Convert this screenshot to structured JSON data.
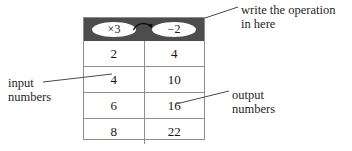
{
  "diagram": {
    "header": {
      "background_color": "#4d4d4d",
      "input_operation": "×3",
      "output_operation": "−2",
      "arrow_icon": "curved-arrow-icon"
    },
    "table": {
      "border_color": "#8d8d8d",
      "columns": [
        "input",
        "output"
      ],
      "rows": [
        {
          "input": "2",
          "output": "4"
        },
        {
          "input": "4",
          "output": "10"
        },
        {
          "input": "6",
          "output": "16"
        },
        {
          "input": "8",
          "output": "22"
        }
      ]
    },
    "annotations": {
      "operation": "write the operation\nin here",
      "input": "input\nnumbers",
      "output": "output\nnumbers"
    }
  }
}
